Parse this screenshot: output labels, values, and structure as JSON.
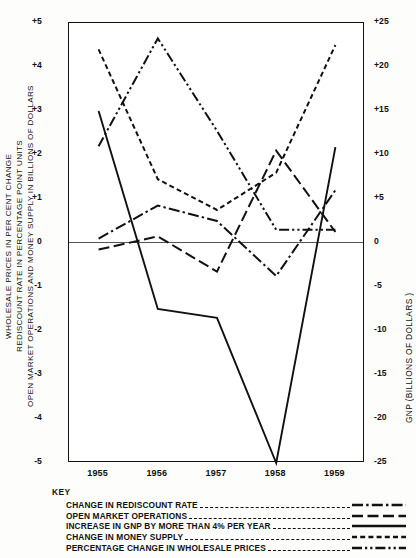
{
  "axes": {
    "left_title": "WHOLESALE PRICES IN PER CENT CHANGE\nREDISCOUNT RATE IN PERCENTAGE POINT UNITS\nOPEN MARKET OPERATIONS AND MONEY SUPPLY IN BILLIONS OF DOLLARS",
    "right_title": "GNP (BILLIONS OF DOLLARS )",
    "left_ticks": [
      "+5",
      "+4",
      "+3",
      "+2",
      "+1",
      "0",
      "-1",
      "-2",
      "-3",
      "-4",
      "-5"
    ],
    "right_ticks": [
      "+25",
      "+20",
      "+15",
      "+10",
      "+5",
      "0",
      "-5",
      "-10",
      "-15",
      "-20",
      "-25"
    ],
    "x_ticks": [
      "1955",
      "1956",
      "1957",
      "1958",
      "1959"
    ]
  },
  "key": {
    "title": "KEY",
    "items": [
      {
        "label": "CHANGE IN REDISCOUNT RATE",
        "style": "dash-dot"
      },
      {
        "label": "OPEN MARKET OPERATIONS",
        "style": "long-dash"
      },
      {
        "label": "INCREASE IN GNP BY MORE THAN 4% PER YEAR",
        "style": "solid"
      },
      {
        "label": "CHANGE IN MONEY SUPPLY",
        "style": "short-dash"
      },
      {
        "label": "PERCENTAGE CHANGE IN WHOLESALE PRICES",
        "style": "dash-dot-dot"
      }
    ]
  },
  "chart_data": {
    "type": "line",
    "title": "",
    "xlabel": "",
    "ylabel": "WHOLESALE PRICES IN PER CENT CHANGE / REDISCOUNT RATE IN PERCENTAGE POINT UNITS / OPEN MARKET OPERATIONS AND MONEY SUPPLY IN BILLIONS OF DOLLARS",
    "y2label": "GNP (BILLIONS OF DOLLARS )",
    "categories": [
      "1955",
      "1956",
      "1957",
      "1958",
      "1959"
    ],
    "ylim": [
      -5,
      5
    ],
    "y2lim": [
      -25,
      25
    ],
    "grid": false,
    "legend": "below",
    "series": [
      {
        "name": "CHANGE IN REDISCOUNT RATE",
        "style": "dash-dot",
        "axis": "left",
        "values": [
          0.1,
          0.85,
          0.5,
          -0.75,
          1.2
        ]
      },
      {
        "name": "OPEN MARKET OPERATIONS",
        "style": "long-dash",
        "axis": "left",
        "values": [
          -0.15,
          0.15,
          -0.65,
          2.1,
          0.25
        ]
      },
      {
        "name": "INCREASE IN GNP BY MORE THAN 4% PER YEAR",
        "style": "solid",
        "axis": "right",
        "values": [
          15.0,
          -7.5,
          -8.5,
          -25.0,
          10.9
        ]
      },
      {
        "name": "CHANGE IN MONEY SUPPLY",
        "style": "short-dash",
        "axis": "left",
        "values": [
          4.4,
          1.45,
          0.75,
          1.6,
          4.5
        ]
      },
      {
        "name": "PERCENTAGE CHANGE IN WHOLESALE PRICES",
        "style": "dash-dot-dot",
        "axis": "left",
        "values": [
          2.2,
          4.65,
          2.55,
          0.3,
          0.3
        ]
      }
    ]
  }
}
